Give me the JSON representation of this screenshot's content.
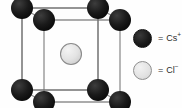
{
  "figure": {
    "background_color": "#fefefe"
  },
  "diagram": {
    "type": "crystal-unit-cell",
    "edge_color": "#8c8c8c",
    "edge_color_dark": "#6e6e6e",
    "cation_color": "#101010",
    "anion_fill": "#e4e4e4",
    "anion_stroke": "#8e8e8e",
    "cation_radius": 11,
    "anion_radius": 10.5,
    "corner_atoms": "Cs+",
    "body_center_atom": "Cl-",
    "front_face": {
      "top_left": [
        22,
        100
      ],
      "top_right": [
        98,
        100
      ],
      "bottom_left": [
        22,
        18
      ],
      "bottom_right": [
        98,
        18
      ]
    },
    "back_face": {
      "top_left": [
        44,
        88
      ],
      "top_right": [
        120,
        88
      ],
      "bottom_left": [
        44,
        6
      ],
      "bottom_right": [
        120,
        6
      ]
    },
    "body_center": [
      71,
      54
    ]
  },
  "legend": {
    "items": [
      {
        "id": "cation",
        "swatch": "filled-dark-circle",
        "equals": "=",
        "species": "Cs",
        "charge": "+",
        "label": "= Cs+"
      },
      {
        "id": "anion",
        "swatch": "open-light-circle",
        "equals": "=",
        "species": "Cl",
        "charge": "−",
        "label": "= Cl−"
      }
    ]
  }
}
